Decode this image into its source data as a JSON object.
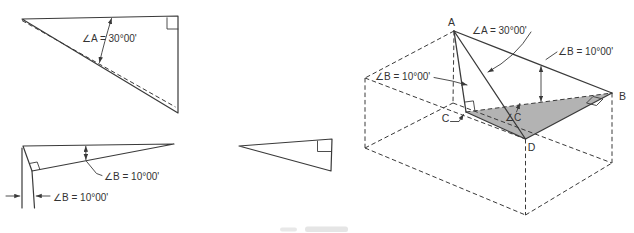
{
  "canvas": {
    "width": 634,
    "height": 232,
    "background": "#ffffff"
  },
  "colors": {
    "line": "#3a3a3a",
    "text": "#333333",
    "shade": "#b3b3b3"
  },
  "views": {
    "auxiliary_view": {
      "angle_a_label": "∠A = 30°00'"
    },
    "front_view": {
      "angle_b_leader_label": "∠B = 10°00'",
      "angle_b_vertical_label": "∠B = 10°00'"
    },
    "side_view": {},
    "pictorial": {
      "vertex_a": "A",
      "vertex_b": "B",
      "vertex_c": "C",
      "vertex_d": "D",
      "angle_a_label": "∠A = 30°00'",
      "angle_b_right_label": "∠B = 10°00'",
      "angle_b_left_label": "∠B = 10°00'",
      "angle_c_label": "∠C"
    }
  }
}
